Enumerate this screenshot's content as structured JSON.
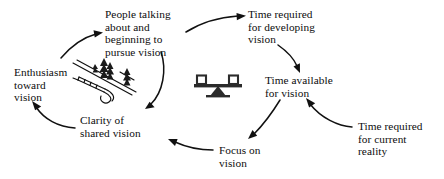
{
  "diagram": {
    "type": "causal-loop-diagram",
    "title": "",
    "background_color": "#ffffff",
    "text_color": "#0d0d0d",
    "stroke_color": "#111111",
    "icon_color": "#2b2b2b",
    "nodes": [
      {
        "id": "people-talking",
        "label": "People talking\nabout and\nbeginning to\npursue vision",
        "x": 105,
        "y": 8
      },
      {
        "id": "enthusiasm",
        "label": "Enthusiasm\ntoward\nvision",
        "x": 14,
        "y": 66
      },
      {
        "id": "clarity",
        "label": "Clarity of\nshared vision",
        "x": 80,
        "y": 114
      },
      {
        "id": "time-required-developing",
        "label": "Time required\nfor developing\nvision",
        "x": 248,
        "y": 8
      },
      {
        "id": "time-available",
        "label": "Time available\nfor vision",
        "x": 265,
        "y": 74
      },
      {
        "id": "time-required-current",
        "label": "Time required\nfor current\nreality",
        "x": 358,
        "y": 120
      },
      {
        "id": "focus-on-vision",
        "label": "Focus on\nvision",
        "x": 219,
        "y": 144
      }
    ],
    "links": [
      {
        "id": "enthusiasm-to-people-talking",
        "from": "enthusiasm",
        "to": "people-talking"
      },
      {
        "id": "people-talking-to-clarity",
        "from": "people-talking",
        "to": "clarity"
      },
      {
        "id": "clarity-to-enthusiasm",
        "from": "clarity",
        "to": "enthusiasm"
      },
      {
        "id": "people-talking-to-time-required-developing",
        "from": "people-talking",
        "to": "time-required-developing"
      },
      {
        "id": "time-required-developing-to-time-available",
        "from": "time-required-developing",
        "to": "time-available"
      },
      {
        "id": "time-required-current-to-time-available",
        "from": "time-required-current",
        "to": "time-available"
      },
      {
        "id": "time-available-to-focus-on-vision",
        "from": "time-available",
        "to": "focus-on-vision"
      },
      {
        "id": "focus-on-vision-to-clarity",
        "from": "focus-on-vision",
        "to": "clarity"
      }
    ],
    "illustrations": [
      {
        "id": "landscape-telescope-illustration",
        "description": "hillside with pine trees and telescope",
        "x": 72,
        "y": 58
      },
      {
        "id": "balance-scale-illustration",
        "description": "balance scale / seesaw",
        "x": 192,
        "y": 70
      }
    ]
  }
}
